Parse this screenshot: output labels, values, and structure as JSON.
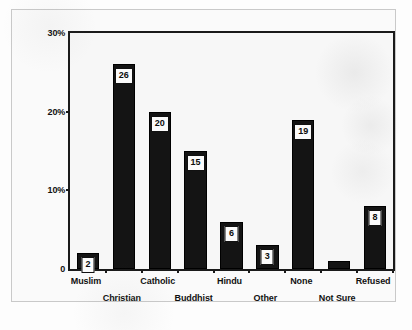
{
  "chart_data": {
    "type": "bar",
    "title": "",
    "subtitle": "",
    "xlabel": "",
    "ylabel": "",
    "ylim": [
      0,
      30
    ],
    "grid": false,
    "legend": null,
    "yticks": [
      {
        "value": 0,
        "label": "0"
      },
      {
        "value": 10,
        "label": "10%"
      },
      {
        "value": 20,
        "label": "20%"
      },
      {
        "value": 30,
        "label": "30%"
      }
    ],
    "categories": [
      "Muslim",
      "Christian",
      "Catholic",
      "Buddhist",
      "Hindu",
      "Other",
      "None",
      "Not Sure",
      "Refused"
    ],
    "values": [
      2,
      26,
      20,
      15,
      6,
      3,
      19,
      1,
      8
    ],
    "data_labels": [
      "2",
      "26",
      "20",
      "15",
      "6",
      "3",
      "19",
      "",
      "8"
    ],
    "label_rows": [
      0,
      1,
      0,
      1,
      0,
      1,
      0,
      1,
      0
    ],
    "bar_color": "#141414",
    "label_box_color": "#fbfbfb",
    "axis_color": "#1a1a1a",
    "plot_background": "#f7f7f7",
    "page_background": "#fafafa"
  }
}
